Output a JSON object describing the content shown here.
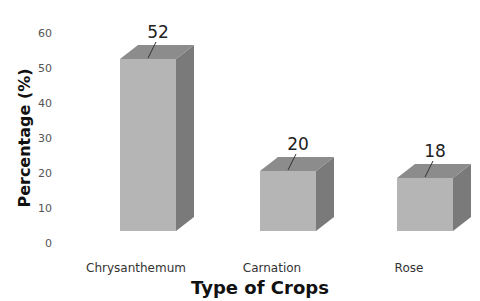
{
  "chart_data": {
    "type": "bar",
    "style": "3d-column",
    "title": "",
    "xlabel": "Type of Crops",
    "ylabel": "Percentage (%)",
    "categories": [
      "Chrysanthemum",
      "Carnation",
      "Rose"
    ],
    "values": [
      52,
      20,
      18
    ],
    "data_labels": [
      "52",
      "20",
      "18"
    ],
    "ylim": [
      0,
      60
    ],
    "yticks": [
      "0",
      "10",
      "20",
      "30",
      "40",
      "50",
      "60"
    ],
    "grid": false,
    "legend": null
  },
  "colors": {
    "bar_front": "#b5b5b5",
    "bar_top": "#8c8c8c",
    "bar_side": "#7a7a7a",
    "leader_line": "#333333"
  }
}
